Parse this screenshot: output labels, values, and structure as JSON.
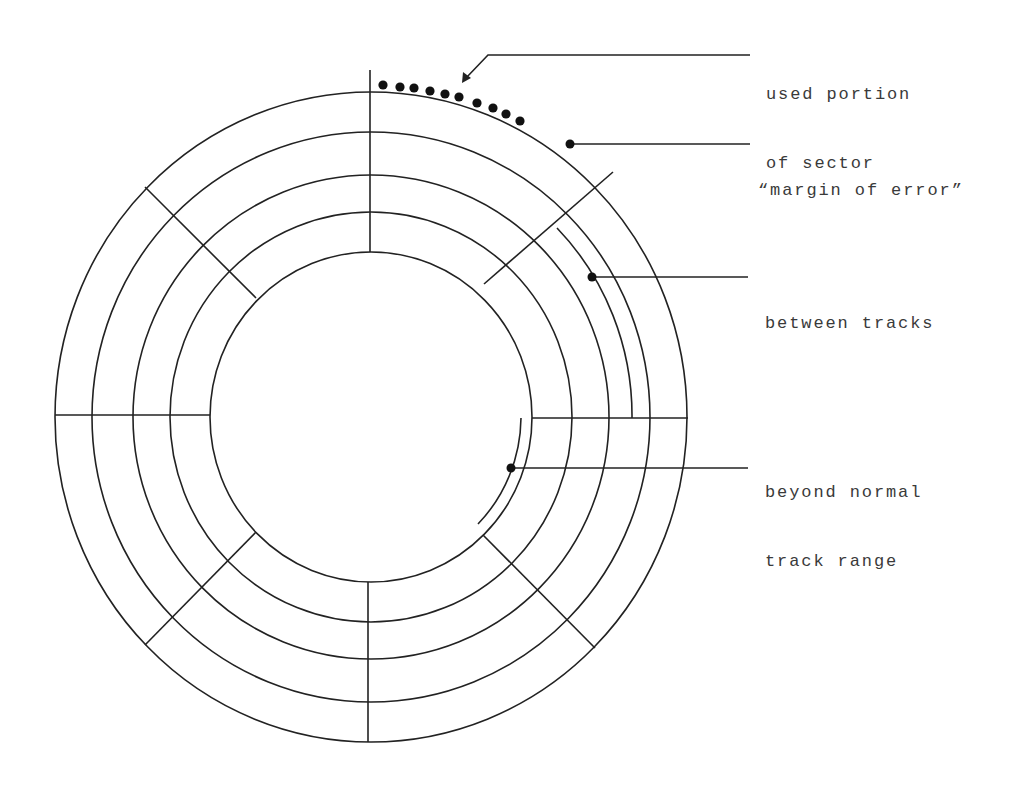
{
  "diagram": {
    "center": {
      "x": 371,
      "y": 417
    },
    "track_radii": [
      {
        "rx": 316,
        "ry": 325
      },
      {
        "rx": 279,
        "ry": 285
      },
      {
        "rx": 238,
        "ry": 242
      },
      {
        "rx": 201,
        "ry": 205
      },
      {
        "rx": 161,
        "ry": 165
      }
    ],
    "sector_dividers": [
      {
        "x1": 370,
        "y1": 70,
        "x2": 370,
        "y2": 252
      },
      {
        "x1": 145,
        "y1": 187,
        "x2": 256,
        "y2": 298
      },
      {
        "x1": 55,
        "y1": 415,
        "x2": 210,
        "y2": 415
      },
      {
        "x1": 145,
        "y1": 645,
        "x2": 256,
        "y2": 532
      },
      {
        "x1": 368,
        "y1": 582,
        "x2": 368,
        "y2": 742
      },
      {
        "x1": 483,
        "y1": 535,
        "x2": 595,
        "y2": 648
      },
      {
        "x1": 532,
        "y1": 418,
        "x2": 688,
        "y2": 418
      },
      {
        "x1": 613,
        "y1": 172,
        "x2": 484,
        "y2": 284
      }
    ],
    "used_sector_dots": [
      [
        383,
        85
      ],
      [
        400,
        87
      ],
      [
        414,
        88
      ],
      [
        430,
        91
      ],
      [
        445,
        94
      ],
      [
        459,
        97
      ],
      [
        477,
        103
      ],
      [
        493,
        108
      ],
      [
        506,
        114
      ],
      [
        520,
        121
      ]
    ],
    "line_color": "#222222",
    "text_color": "#3a3a3a"
  },
  "annotations": [
    {
      "id": "used-portion",
      "lines": [
        "used portion",
        "of sector"
      ],
      "text_x": 766,
      "text_y": 37
    },
    {
      "id": "margin-of-error",
      "lines": [
        "“margin of error”"
      ],
      "text_x": 762,
      "text_y": 133
    },
    {
      "id": "between-tracks",
      "lines": [
        "between tracks"
      ],
      "text_x": 765,
      "text_y": 266
    },
    {
      "id": "beyond-track-range",
      "lines": [
        "beyond normal",
        "track range"
      ],
      "text_x": 765,
      "text_y": 435
    }
  ]
}
